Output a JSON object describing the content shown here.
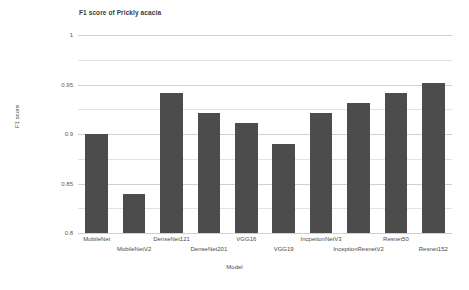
{
  "chart_data": {
    "type": "bar",
    "title": "F1 score of Prickly acacia",
    "xlabel": "Model",
    "ylabel": "F1 score",
    "ylim": [
      0.8,
      1.0
    ],
    "yticks": [
      "0.8",
      "0.85",
      "0.9",
      "0.95",
      "1"
    ],
    "ytick_values": [
      0.8,
      0.85,
      0.9,
      0.95,
      1
    ],
    "minor_gridlines": [
      0.825,
      0.875,
      0.925,
      0.975
    ],
    "grid": true,
    "legend": "none",
    "bar_color": "#4c4c4c",
    "background_color": "#ffffff",
    "grid_color": "#d0d0d0",
    "categories": [
      "MobileNet",
      "MobileNetV2",
      "DenseNet121",
      "DenseNet201",
      "VGG16",
      "VGG19",
      "IncpetionNetV3",
      "InceptionResnetV2",
      "Resnet50",
      "Resnet152"
    ],
    "values": [
      0.9,
      0.839,
      0.941,
      0.921,
      0.911,
      0.89,
      0.921,
      0.931,
      0.941,
      0.952
    ]
  }
}
